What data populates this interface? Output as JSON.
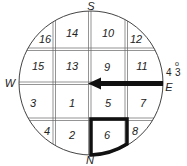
{
  "diagram": {
    "type": "compass-grid-circle",
    "circle": {
      "cx": 91,
      "cy": 83,
      "r": 72
    },
    "directions": {
      "top": "S",
      "bottom": "N",
      "left": "W",
      "right": "E"
    },
    "annotation": {
      "text": "4",
      "superscript": "o",
      "subscript": "3"
    },
    "grid": {
      "columns": 4,
      "rows": 4,
      "cells": [
        [
          "16",
          "14",
          "10",
          "12"
        ],
        [
          "15",
          "13",
          "9",
          "11"
        ],
        [
          "3",
          "1",
          "5",
          "7"
        ],
        [
          "4",
          "2",
          "6",
          "8"
        ]
      ]
    },
    "highlighted_cell": "6",
    "arrow": {
      "from": "E",
      "to": "center",
      "description": "Arrow pointing from E toward center (West)"
    },
    "colors": {
      "line": "#555555",
      "ink": "#111111",
      "background": "#ffffff"
    }
  }
}
